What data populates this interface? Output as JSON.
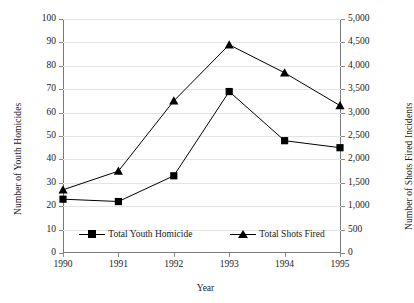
{
  "chart_data": {
    "type": "line",
    "title": "",
    "xlabel": "Year",
    "ylabel": "Number of Youth Homicides",
    "ylabel_secondary": "Number of Shots Fired Incidents",
    "categories": [
      "1990",
      "1991",
      "1992",
      "1993",
      "1994",
      "1995"
    ],
    "x": [
      1990,
      1991,
      1992,
      1993,
      1994,
      1995
    ],
    "ylim": [
      0,
      100
    ],
    "ylim_secondary": [
      0,
      5000
    ],
    "yticks": [
      "0",
      "10",
      "20",
      "30",
      "40",
      "50",
      "60",
      "70",
      "80",
      "90",
      "100"
    ],
    "ytick_values": [
      0,
      10,
      20,
      30,
      40,
      50,
      60,
      70,
      80,
      90,
      100
    ],
    "yticks_secondary": [
      "0",
      "500",
      "1,000",
      "1,500",
      "2,000",
      "2,500",
      "3,000",
      "3,500",
      "4,000",
      "4,500",
      "5,000"
    ],
    "ytick_values_secondary": [
      0,
      500,
      1000,
      1500,
      2000,
      2500,
      3000,
      3500,
      4000,
      4500,
      5000
    ],
    "grid": true,
    "legend_position": "inside-bottom-center",
    "series": [
      {
        "name": "Total Youth Homicide",
        "marker": "square",
        "axis": "left",
        "values": [
          23,
          22,
          33,
          69,
          48,
          45
        ]
      },
      {
        "name": "Total Shots Fired",
        "marker": "triangle",
        "axis": "right",
        "values": [
          1350,
          1750,
          3250,
          4450,
          3850,
          3150
        ],
        "values_on_left_scale": [
          27,
          35,
          65,
          89,
          77,
          63
        ]
      }
    ]
  },
  "legend": {
    "entries": [
      {
        "label": "Total Youth Homicide",
        "marker": "square"
      },
      {
        "label": "Total Shots Fired",
        "marker": "triangle"
      }
    ]
  },
  "colors": {
    "series": "#000000",
    "grid": "#e4e4e4",
    "axis": "#7a7a7a",
    "text": "#1a1a1a",
    "background": "#ffffff"
  }
}
